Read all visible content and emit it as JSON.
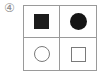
{
  "option_label": "④",
  "grid": {
    "rows": 2,
    "columns": 2,
    "border_color": "#9a9a9a",
    "cells": [
      {
        "position": "top-left",
        "shape": "square",
        "style": "filled",
        "color": "#1c1c1c"
      },
      {
        "position": "top-right",
        "shape": "circle",
        "style": "filled",
        "color": "#151515"
      },
      {
        "position": "bottom-left",
        "shape": "circle",
        "style": "outline",
        "color": "#7a7a7a"
      },
      {
        "position": "bottom-right",
        "shape": "square",
        "style": "outline",
        "color": "#7a7a7a"
      }
    ]
  }
}
